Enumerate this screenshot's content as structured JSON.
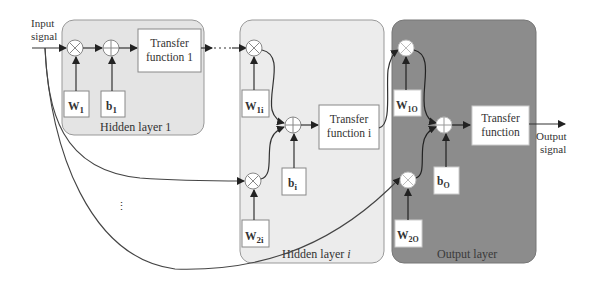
{
  "diagram": {
    "input_label": [
      "Input",
      "signal"
    ],
    "output_label": [
      "Output",
      "signal"
    ],
    "ellipsis": "⋮",
    "layers": [
      {
        "id": "hidden-layer-1",
        "title": "Hidden layer 1",
        "weights": [
          {
            "main": "W",
            "sub": "1"
          }
        ],
        "bias": {
          "main": "b",
          "sub": "1"
        },
        "transfer": [
          "Transfer",
          "function 1"
        ],
        "fill": "#e6e6e6"
      },
      {
        "id": "hidden-layer-i",
        "title": "Hidden layer i",
        "weights": [
          {
            "main": "W",
            "sub": "1i"
          },
          {
            "main": "W",
            "sub": "2i"
          }
        ],
        "bias": {
          "main": "b",
          "sub": "i"
        },
        "transfer": [
          "Transfer",
          "function i"
        ],
        "fill": "#ededed"
      },
      {
        "id": "output-layer",
        "title": "Output layer",
        "weights": [
          {
            "main": "W",
            "sub": "1O"
          },
          {
            "main": "W",
            "sub": "2O"
          }
        ],
        "bias": {
          "main": "b",
          "sub": "O"
        },
        "transfer": [
          "Transfer",
          "function"
        ],
        "fill": "#8e8e8e"
      }
    ],
    "colors": {
      "line": "#333333",
      "box_border": "#777777",
      "box_fill": "#ffffff"
    }
  }
}
